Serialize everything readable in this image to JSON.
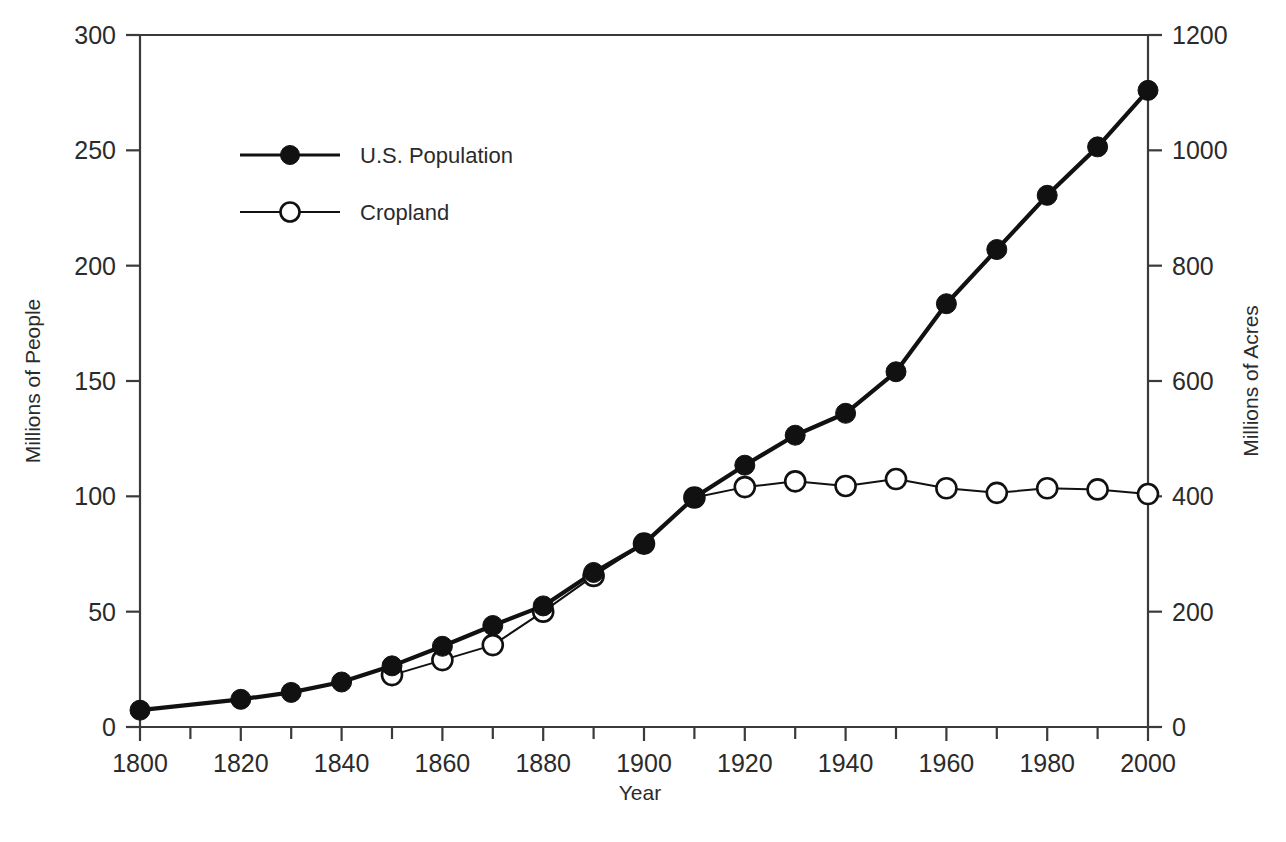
{
  "chart_data": {
    "type": "line",
    "title": "",
    "xlabel": "Year",
    "ylabel": "Millions of People",
    "y2label": "Millions of Acres",
    "xlim": [
      1800,
      2000
    ],
    "ylim": [
      0,
      300
    ],
    "y2lim": [
      0,
      1200
    ],
    "grid": false,
    "legend_position": "upper-left-inside",
    "x_ticks_major": [
      1800,
      1820,
      1840,
      1860,
      1880,
      1900,
      1920,
      1940,
      1960,
      1980,
      2000
    ],
    "x_ticks_minor": [
      1810,
      1830,
      1850,
      1870,
      1890,
      1910,
      1930,
      1950,
      1970,
      1990
    ],
    "y_ticks": [
      0,
      50,
      100,
      150,
      200,
      250,
      300
    ],
    "y2_ticks": [
      0,
      200,
      400,
      600,
      800,
      1000,
      1200
    ],
    "x": [
      1800,
      1810,
      1820,
      1830,
      1840,
      1850,
      1860,
      1870,
      1880,
      1890,
      1900,
      1910,
      1920,
      1930,
      1940,
      1950,
      1960,
      1970,
      1980,
      1990,
      2000
    ],
    "series": [
      {
        "name": "U.S. Population",
        "axis": "left",
        "units": "millions of people",
        "marker": "filled-circle",
        "x": [
          1800,
          1820,
          1830,
          1840,
          1850,
          1860,
          1870,
          1880,
          1890,
          1900,
          1910,
          1920,
          1930,
          1940,
          1950,
          1960,
          1970,
          1980,
          1990,
          2000
        ],
        "values": [
          7.3,
          12.0,
          15.0,
          19.5,
          26.5,
          35.0,
          44.0,
          52.5,
          67.0,
          79.5,
          99.5,
          113.5,
          126.5,
          136.0,
          154.0,
          183.5,
          207.0,
          230.5,
          251.5,
          276.0
        ]
      },
      {
        "name": "Cropland",
        "axis": "right",
        "units": "millions of acres",
        "marker": "open-circle",
        "x": [
          1850,
          1860,
          1870,
          1880,
          1890,
          1900,
          1910,
          1920,
          1930,
          1940,
          1950,
          1960,
          1970,
          1980,
          1990,
          2000
        ],
        "values_left_scale": [
          22.5,
          29.0,
          35.5,
          50.0,
          65.5,
          79.5,
          99.5,
          104.0,
          106.5,
          104.5,
          107.5,
          103.5,
          101.5,
          103.5,
          103.0,
          101.0
        ],
        "values": [
          90,
          116,
          142,
          200,
          262,
          318,
          398,
          416,
          426,
          418,
          430,
          414,
          406,
          414,
          412,
          404
        ]
      }
    ]
  },
  "legend": {
    "items": [
      {
        "label": "U.S. Population",
        "marker": "filled-circle"
      },
      {
        "label": "Cropland",
        "marker": "open-circle"
      }
    ]
  },
  "axes": {
    "left_title": "Millions of People",
    "right_title": "Millions of Acres",
    "bottom_title": "Year"
  }
}
